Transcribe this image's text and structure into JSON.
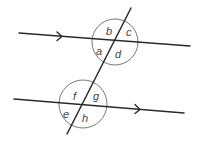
{
  "diagram": {
    "title": "",
    "parallel_lines": [
      {
        "name": "upper-line",
        "arrow_direction": "right"
      },
      {
        "name": "lower-line",
        "arrow_direction": "right"
      }
    ],
    "transversal": {
      "name": "transversal"
    },
    "intersections": [
      {
        "name": "upper-intersection",
        "angles": {
          "top_left": "b",
          "top_right": "c",
          "bottom_left": "a",
          "bottom_right": "d"
        }
      },
      {
        "name": "lower-intersection",
        "angles": {
          "top_left": "f",
          "top_right": "g",
          "bottom_left": "e",
          "bottom_right": "h"
        }
      }
    ],
    "colors": {
      "line": "#2a2a2a",
      "circle": "#555555",
      "label": "#444444",
      "background": "#ffffff"
    }
  }
}
